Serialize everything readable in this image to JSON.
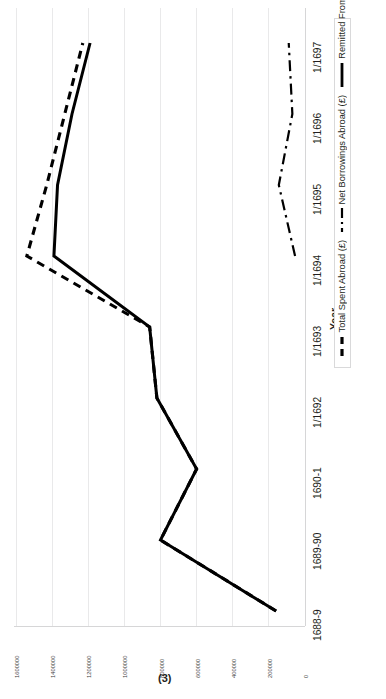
{
  "figure": {
    "caption": "(3)"
  },
  "axes": {
    "category_axis": {
      "title": "Year",
      "categories": [
        "1688-9",
        "1689-90",
        "1690-1",
        "1/1692",
        "1/1693",
        "1/1694",
        "1/1695",
        "1/1696",
        "1/1697"
      ]
    },
    "value_axis": {
      "ticks": [
        "1600000",
        "1400000",
        "1200000",
        "1000000",
        "800000",
        "600000",
        "400000",
        "200000",
        "0"
      ]
    }
  },
  "legend": {
    "items": [
      {
        "label": "Total Spent Abroad (£)",
        "style": "dashed",
        "color": "#000000"
      },
      {
        "label": "Net Borrowings Abroad (£)",
        "style": "dash-dot",
        "color": "#000000"
      },
      {
        "label": "Remitted From Home (£)",
        "style": "solid",
        "color": "#000000"
      }
    ]
  },
  "chart_data": {
    "type": "line",
    "title": "(3)",
    "xlabel": "Year",
    "ylabel": "",
    "orientation": "rotated-90",
    "grid": true,
    "legend_position": "right",
    "categories": [
      "1688-9",
      "1689-90",
      "1690-1",
      "1/1692",
      "1/1693",
      "1/1694",
      "1/1695",
      "1/1696",
      "1/1697"
    ],
    "ylim": [
      0,
      1600000
    ],
    "ytick_values": [
      1600000,
      1400000,
      1200000,
      1000000,
      800000,
      600000,
      400000,
      200000,
      0
    ],
    "series": [
      {
        "name": "Total Spent Abroad (£)",
        "style": "dashed",
        "values": [
          160000,
          800000,
          600000,
          820000,
          860000,
          1540000,
          1430000,
          1330000,
          1230000
        ]
      },
      {
        "name": "Net Borrowings Abroad (£)",
        "style": "dash-dot",
        "values": [
          null,
          null,
          null,
          null,
          null,
          55000,
          145000,
          70000,
          90000
        ]
      },
      {
        "name": "Remitted From Home (£)",
        "style": "solid",
        "values": [
          160000,
          800000,
          600000,
          820000,
          860000,
          1390000,
          1370000,
          1290000,
          1190000
        ]
      }
    ]
  }
}
